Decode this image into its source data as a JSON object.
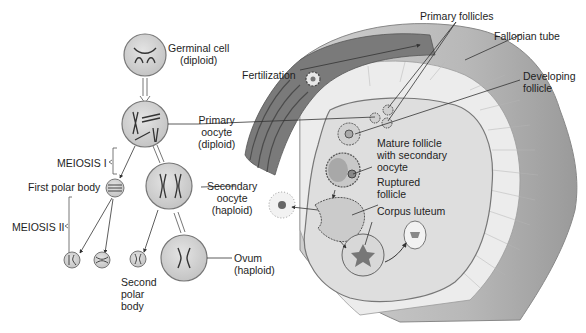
{
  "labels": {
    "germinal_cell": [
      "Germinal cell",
      "(diploid)"
    ],
    "primary_oocyte": [
      "Primary",
      "oocyte",
      "(diploid)"
    ],
    "meiosis_1": "MEIOSIS I",
    "first_polar_body": "First polar body",
    "meiosis_2": "MEIOSIS II",
    "secondary_oocyte": [
      "Secondary",
      "oocyte",
      "(haploid)"
    ],
    "second_polar_body": [
      "Second",
      "polar",
      "body"
    ],
    "ovum": [
      "Ovum",
      "(haploid)"
    ],
    "fertilization": "Fertilization",
    "primary_follicles": "Primary follicles",
    "fallopian_tube": "Fallopian tube",
    "developing_follicle": [
      "Developing",
      "follicle"
    ],
    "mature_follicle": [
      "Mature follicle",
      "with secondary",
      "oocyte"
    ],
    "ruptured_follicle": [
      "Ruptured",
      "follicle"
    ],
    "corpus_luteum": "Corpus luteum"
  },
  "colors": {
    "cell_fill": "#d6d6d6",
    "cell_stroke": "#7a7a7a",
    "tube_fill": "#bdbdbd",
    "tube_dark": "#8e8e8e",
    "ovary_fill": "#e2e2e2",
    "text": "#1e1e1e"
  }
}
